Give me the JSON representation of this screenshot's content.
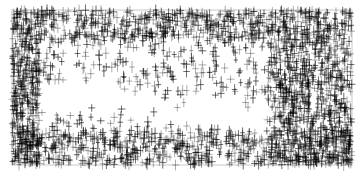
{
  "chart_data": {
    "type": "scatter",
    "title": "",
    "xlabel": "",
    "ylabel": "",
    "marker": "+",
    "marker_color": "#000000",
    "marker_opacity": 0.55,
    "frame_color": "#c8c8c8",
    "grid": false,
    "legend": null,
    "plot_area": {
      "x0": 12,
      "y0": 10,
      "x1": 352,
      "y1": 165
    },
    "point_count_estimate": 4000,
    "density_regions": [
      {
        "name": "left-edge-dense",
        "x": [
          12,
          40
        ],
        "y": [
          10,
          165
        ],
        "weight": 0.12
      },
      {
        "name": "right-column-dense",
        "x": [
          268,
          352
        ],
        "y": [
          10,
          165
        ],
        "weight": 0.26
      },
      {
        "name": "bottom-band-dense",
        "x": [
          12,
          352
        ],
        "y": [
          130,
          165
        ],
        "weight": 0.18
      },
      {
        "name": "top-band",
        "x": [
          40,
          268
        ],
        "y": [
          10,
          40
        ],
        "weight": 0.12
      },
      {
        "name": "background-scatter",
        "x": [
          12,
          352
        ],
        "y": [
          10,
          165
        ],
        "weight": 0.32
      }
    ],
    "sparse_band": {
      "description": "light diagonal band from upper-left/center toward lower-right",
      "from": [
        40,
        95
      ],
      "to": [
        270,
        120
      ],
      "width": 28
    }
  }
}
